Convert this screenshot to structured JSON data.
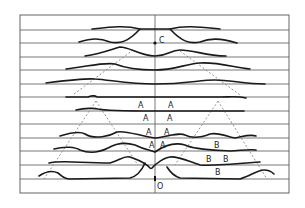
{
  "diagram": {
    "frame": {
      "x": 20,
      "y": 15,
      "width": 269,
      "height": 178
    },
    "center_x": 155,
    "grid_lines_y": [
      30,
      43,
      57,
      70,
      84,
      97,
      111,
      124,
      138,
      151,
      165,
      179
    ],
    "colors": {
      "line": "#555555",
      "curve": "#1a1a1a",
      "dashed": "#888888"
    },
    "points": {
      "C": {
        "label": "C",
        "x": 155,
        "y": 43
      },
      "O": {
        "label": "O",
        "x": 155,
        "y": 179
      }
    },
    "labels": [
      {
        "text": "A",
        "x": 138,
        "y": 108
      },
      {
        "text": "A",
        "x": 168,
        "y": 108
      },
      {
        "text": "A",
        "x": 143,
        "y": 121
      },
      {
        "text": "A",
        "x": 167,
        "y": 121
      },
      {
        "text": "A",
        "x": 146,
        "y": 135
      },
      {
        "text": "A",
        "x": 164,
        "y": 135
      },
      {
        "text": "A",
        "x": 149,
        "y": 148
      },
      {
        "text": "A",
        "x": 160,
        "y": 148
      },
      {
        "text": "B",
        "x": 214,
        "y": 148
      },
      {
        "text": "B",
        "x": 206,
        "y": 162
      },
      {
        "text": "B",
        "x": 223,
        "y": 162
      },
      {
        "text": "B",
        "x": 215,
        "y": 175
      }
    ]
  }
}
